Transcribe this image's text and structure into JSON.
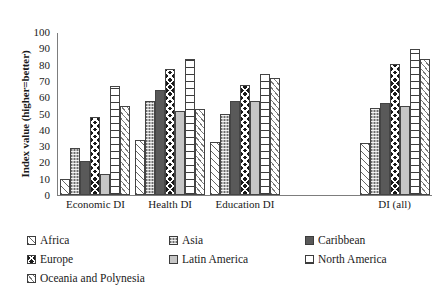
{
  "chart_data": {
    "type": "bar",
    "title": "",
    "xlabel": "",
    "ylabel": "Index value (higher=better)",
    "ylim": [
      0,
      100
    ],
    "ytick_labels": [
      "100",
      "90",
      "80",
      "70",
      "60",
      "50",
      "40",
      "30",
      "20",
      "10",
      "0"
    ],
    "ytick_values": [
      100,
      90,
      80,
      70,
      60,
      50,
      40,
      30,
      20,
      10,
      0
    ],
    "grid": false,
    "legend_position": "bottom",
    "categories": [
      "Economic DI",
      "Health DI",
      "Education DI",
      "",
      "DI (all)"
    ],
    "visible_categories": [
      "Economic DI",
      "Health DI",
      "Education DI",
      "DI (all)"
    ],
    "series": [
      {
        "name": "Africa",
        "pattern": "diagonal-hatch-sparse",
        "values": [
          10,
          34,
          33,
          null,
          32
        ]
      },
      {
        "name": "Asia",
        "pattern": "vertical-dotted-gray",
        "values": [
          29,
          58,
          50,
          null,
          54
        ]
      },
      {
        "name": "Caribbean",
        "pattern": "solid-dark-gray",
        "values": [
          21,
          65,
          58,
          null,
          57
        ]
      },
      {
        "name": "Europe",
        "pattern": "black-diamond",
        "values": [
          48,
          78,
          68,
          null,
          81
        ]
      },
      {
        "name": "Latin America",
        "pattern": "solid-light-gray",
        "values": [
          13,
          52,
          58,
          null,
          55
        ]
      },
      {
        "name": "North America",
        "pattern": "horizontal-grid",
        "values": [
          67,
          84,
          75,
          null,
          90
        ]
      },
      {
        "name": "Oceania and Polynesia",
        "pattern": "diagonal-hatch-dense",
        "values": [
          55,
          53,
          72,
          null,
          84
        ]
      }
    ]
  },
  "legend": {
    "rows": [
      [
        {
          "label": "Africa",
          "pattern": "p-africa"
        },
        {
          "label": "Asia",
          "pattern": "p-asia"
        },
        {
          "label": "Caribbean",
          "pattern": "p-caribbean"
        }
      ],
      [
        {
          "label": "Europe",
          "pattern": "p-europe"
        },
        {
          "label": "Latin America",
          "pattern": "p-latin"
        },
        {
          "label": "North America",
          "pattern": "p-northamerica"
        }
      ],
      [
        {
          "label": "Oceania and Polynesia",
          "pattern": "p-oceania"
        }
      ]
    ]
  },
  "colors": {
    "axis": "#7d7d7d",
    "text": "#1a1a1a",
    "background": "#ffffff",
    "bar_border": "#444444"
  }
}
